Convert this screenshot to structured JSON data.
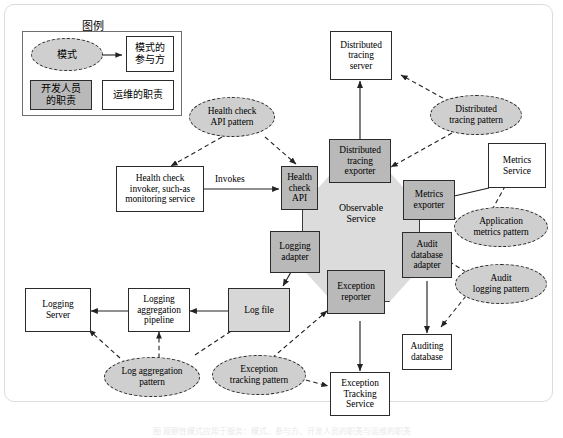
{
  "diagram": {
    "legend": {
      "heading": "图例",
      "pattern_label": "模式",
      "participant_label": "模式的\n参与方",
      "dev_label": "开发人员\n的职责",
      "ops_label": "运维的职责"
    },
    "center": {
      "label": "Observable\nService"
    },
    "adapters": [
      {
        "id": "health-check-api",
        "label": "Health\ncheck\nAPI"
      },
      {
        "id": "distributed-tracing-exporter",
        "label": "Distributed\ntracing\nexporter"
      },
      {
        "id": "metrics-exporter",
        "label": "Metrics\nexporter"
      },
      {
        "id": "audit-database-adapter",
        "label": "Audit\ndatabase\nadapter"
      },
      {
        "id": "exception-reporter",
        "label": "Exception\nreporter"
      },
      {
        "id": "logging-adapter",
        "label": "Logging\nadapter"
      }
    ],
    "external_boxes": [
      {
        "id": "health-check-invoker",
        "label": "Health check\ninvoker, such-as\nmonitoring service"
      },
      {
        "id": "distributed-tracing-server",
        "label": "Distributed\ntracing\nserver"
      },
      {
        "id": "metrics-service",
        "label": "Metrics\nService"
      },
      {
        "id": "auditing-database",
        "label": "Auditing\ndatabase"
      },
      {
        "id": "exception-tracking-service",
        "label": "Exception\nTracking\nService"
      },
      {
        "id": "log-file",
        "label": "Log file"
      },
      {
        "id": "logging-aggregation-pipeline",
        "label": "Logging\naggregation\npipeline"
      },
      {
        "id": "logging-server",
        "label": "Logging\nServer"
      }
    ],
    "patterns": [
      {
        "id": "health-check-api-pattern",
        "label": "Health check\nAPI pattern"
      },
      {
        "id": "distributed-tracing-pattern",
        "label": "Distributed\ntracing pattern"
      },
      {
        "id": "application-metrics-pattern",
        "label": "Application\nmetrics pattern"
      },
      {
        "id": "audit-logging-pattern",
        "label": "Audit\nlogging pattern"
      },
      {
        "id": "exception-tracking-pattern",
        "label": "Exception\ntracking pattern"
      },
      {
        "id": "log-aggregation-pattern",
        "label": "Log aggregation\npattern"
      }
    ],
    "edge_labels": [
      {
        "id": "invokes",
        "label": "Invokes"
      }
    ],
    "colors": {
      "responsibility_fill": "#b9b9b9",
      "pattern_fill": "#cfcfcf",
      "service_fill": "#dcdcdc",
      "stroke": "#2b2b2b",
      "page_background": "#ffffff"
    },
    "caption": "图  观察性模式应用于服务：模式、参与方、开发人员的职责与运维的职责"
  }
}
